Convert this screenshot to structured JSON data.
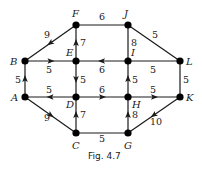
{
  "figure": {
    "caption": "Fig. 4.7",
    "nodes": [
      {
        "id": "A",
        "x": 25,
        "y": 97,
        "lx": 11,
        "ly": 101
      },
      {
        "id": "B",
        "x": 25,
        "y": 61,
        "lx": 10,
        "ly": 65
      },
      {
        "id": "C",
        "x": 76,
        "y": 133,
        "lx": 72,
        "ly": 149
      },
      {
        "id": "D",
        "x": 76,
        "y": 97,
        "lx": 66,
        "ly": 108
      },
      {
        "id": "E",
        "x": 76,
        "y": 61,
        "lx": 66,
        "ly": 56
      },
      {
        "id": "F",
        "x": 76,
        "y": 25,
        "lx": 72,
        "ly": 17
      },
      {
        "id": "G",
        "x": 128,
        "y": 133,
        "lx": 124,
        "ly": 149
      },
      {
        "id": "H",
        "x": 128,
        "y": 97,
        "lx": 132,
        "ly": 108
      },
      {
        "id": "I",
        "x": 128,
        "y": 61,
        "lx": 131,
        "ly": 56
      },
      {
        "id": "J",
        "x": 128,
        "y": 25,
        "lx": 124,
        "ly": 17
      },
      {
        "id": "K",
        "x": 180,
        "y": 97,
        "lx": 186,
        "ly": 101
      },
      {
        "id": "L",
        "x": 180,
        "y": 61,
        "lx": 186,
        "ly": 65
      }
    ],
    "edges": [
      {
        "from": "F",
        "to": "B",
        "weight": "9",
        "directed": true,
        "wx": 44,
        "wy": 38
      },
      {
        "from": "F",
        "to": "J",
        "weight": "6",
        "directed": false,
        "wx": 99,
        "wy": 20
      },
      {
        "from": "J",
        "to": "L",
        "weight": "5",
        "directed": false,
        "wx": 152,
        "wy": 38
      },
      {
        "from": "E",
        "to": "F",
        "weight": "7",
        "directed": true,
        "wx": 80,
        "wy": 46
      },
      {
        "from": "J",
        "to": "I",
        "weight": "8",
        "directed": false,
        "wx": 131,
        "wy": 46
      },
      {
        "from": "B",
        "to": "E",
        "weight": "5",
        "directed": true,
        "wx": 46,
        "wy": 73
      },
      {
        "from": "I",
        "to": "E",
        "weight": "6",
        "directed": true,
        "wx": 99,
        "wy": 73
      },
      {
        "from": "I",
        "to": "L",
        "weight": "5",
        "directed": false,
        "wx": 150,
        "wy": 73
      },
      {
        "from": "A",
        "to": "B",
        "weight": "5",
        "directed": true,
        "wx": 15,
        "wy": 83
      },
      {
        "from": "E",
        "to": "D",
        "weight": "5",
        "directed": true,
        "wx": 80,
        "wy": 83
      },
      {
        "from": "H",
        "to": "I",
        "weight": "5",
        "directed": true,
        "wx": 132,
        "wy": 83
      },
      {
        "from": "L",
        "to": "K",
        "weight": "5",
        "directed": false,
        "wx": 183,
        "wy": 83
      },
      {
        "from": "D",
        "to": "A",
        "weight": "5",
        "directed": true,
        "wx": 46,
        "wy": 93
      },
      {
        "from": "D",
        "to": "H",
        "weight": "6",
        "directed": true,
        "wx": 99,
        "wy": 93
      },
      {
        "from": "H",
        "to": "K",
        "weight": "5",
        "directed": true,
        "wx": 150,
        "wy": 93
      },
      {
        "from": "A",
        "to": "C",
        "weight": "9",
        "directed": true,
        "wx": 44,
        "wy": 121
      },
      {
        "from": "C",
        "to": "D",
        "weight": "7",
        "directed": true,
        "wx": 80,
        "wy": 118
      },
      {
        "from": "G",
        "to": "H",
        "weight": "8",
        "directed": true,
        "wx": 132,
        "wy": 118
      },
      {
        "from": "K",
        "to": "G",
        "weight": "10",
        "directed": true,
        "wx": 150,
        "wy": 125
      },
      {
        "from": "C",
        "to": "G",
        "weight": "5",
        "directed": false,
        "wx": 99,
        "wy": 142
      }
    ]
  }
}
